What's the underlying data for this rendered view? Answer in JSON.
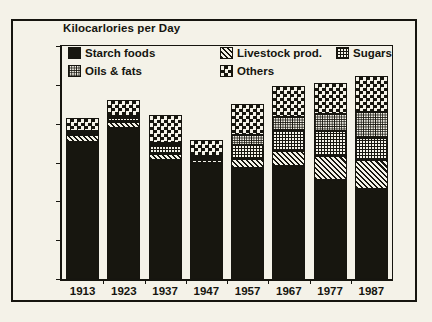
{
  "chart_data": {
    "type": "bar",
    "title": "Kilocarlories per Day",
    "subtitle": "",
    "xlabel": "",
    "ylabel": "",
    "stacked": true,
    "grid": false,
    "legend_position": "top-inside",
    "ylim": [
      0,
      3000
    ],
    "yticks": [
      0,
      500,
      1000,
      1500,
      2000,
      2500,
      3000
    ],
    "ytick_labels": [
      "0",
      "500",
      "1000",
      "1500",
      "2000",
      "2500",
      "3000"
    ],
    "categories": [
      "1913",
      "1923",
      "1937",
      "1947",
      "1957",
      "1967",
      "1977",
      "1987"
    ],
    "series": [
      {
        "name": "Starch foods",
        "pattern": "solid-black",
        "color": "#17160f",
        "values": [
          1760,
          1950,
          1530,
          1500,
          1430,
          1450,
          1270,
          1160
        ]
      },
      {
        "name": "Livestock prod.",
        "pattern": "diagonal-hatch",
        "color": "#17160f",
        "values": [
          90,
          70,
          80,
          30,
          120,
          200,
          310,
          370
        ]
      },
      {
        "name": "Sugars",
        "pattern": "fine-grid",
        "color": "#17160f",
        "values": [
          30,
          50,
          110,
          40,
          180,
          270,
          320,
          280
        ]
      },
      {
        "name": "Oils & fats",
        "pattern": "dense-dot",
        "color": "#17160f",
        "values": [
          30,
          30,
          30,
          20,
          120,
          170,
          220,
          340
        ]
      },
      {
        "name": "Others",
        "pattern": "checkerboard",
        "color": "#17160f",
        "values": [
          160,
          200,
          360,
          200,
          400,
          400,
          410,
          460
        ]
      }
    ],
    "totals": [
      2070,
      2300,
      2110,
      1790,
      2250,
      2490,
      2530,
      2610
    ]
  },
  "legend": {
    "rows": [
      [
        "Starch foods",
        "Livestock prod.",
        "Sugars"
      ],
      [
        "Oils & fats",
        "Others"
      ]
    ]
  },
  "colors": {
    "ink": "#16150f",
    "paper": "#f4f2e8"
  }
}
